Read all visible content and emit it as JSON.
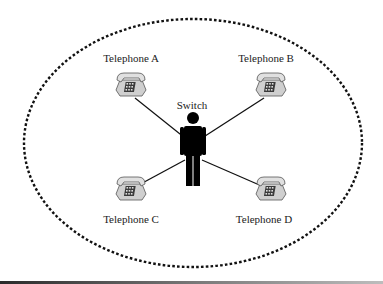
{
  "diagram": {
    "type": "star-topology",
    "boundary": {
      "style": "dotted-ellipse",
      "color": "#111111"
    },
    "center": {
      "label": "Switch",
      "icon": "person-icon"
    },
    "nodes": [
      {
        "id": "A",
        "label": "Telephone A",
        "icon": "telephone-icon"
      },
      {
        "id": "B",
        "label": "Telephone B",
        "icon": "telephone-icon"
      },
      {
        "id": "C",
        "label": "Telephone C",
        "icon": "telephone-icon"
      },
      {
        "id": "D",
        "label": "Telephone D",
        "icon": "telephone-icon"
      }
    ],
    "edges": [
      {
        "from": "Switch",
        "to": "Telephone A"
      },
      {
        "from": "Switch",
        "to": "Telephone B"
      },
      {
        "from": "Switch",
        "to": "Telephone C"
      },
      {
        "from": "Switch",
        "to": "Telephone D"
      }
    ],
    "colors": {
      "line": "#111111",
      "phone_body": "#c8c8c8",
      "phone_outline": "#555555",
      "figure": "#000000"
    }
  }
}
